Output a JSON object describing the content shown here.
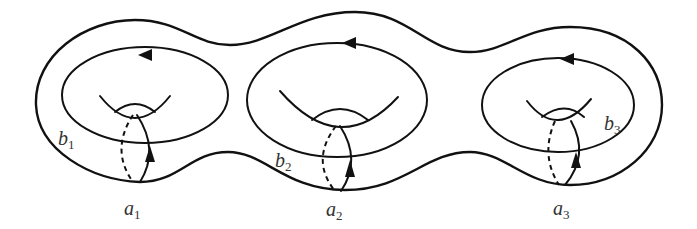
{
  "figure": {
    "labels": {
      "a1": {
        "base": "a",
        "sub": "1"
      },
      "a2": {
        "base": "a",
        "sub": "2"
      },
      "a3": {
        "base": "a",
        "sub": "3"
      },
      "b1": {
        "base": "b",
        "sub": "1"
      },
      "b2": {
        "base": "b",
        "sub": "2"
      },
      "b3": {
        "base": "b",
        "sub": "3"
      }
    },
    "stroke_color": "#111111",
    "label_color": "#333333"
  }
}
